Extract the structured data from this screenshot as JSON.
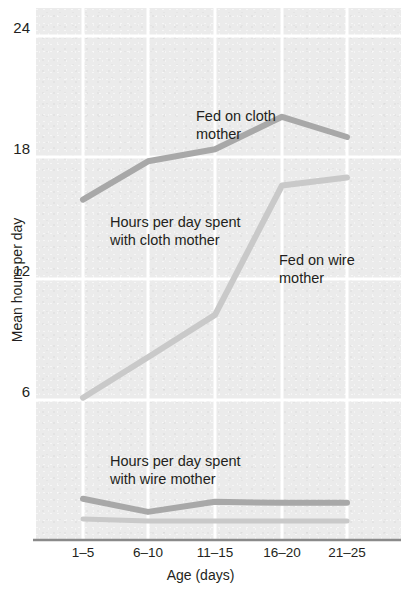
{
  "chart_data": {
    "type": "line",
    "title": "",
    "xlabel": "Age (days)",
    "ylabel": "Mean hours per day",
    "categories": [
      "1–5",
      "6–10",
      "11–15",
      "16–20",
      "21–25"
    ],
    "ylim": [
      0,
      25
    ],
    "yticks": [
      6,
      12,
      18,
      24
    ],
    "ytick_labels": [
      "6",
      "12",
      "18",
      "24"
    ],
    "grid": true,
    "legend": "annotations-inline",
    "series": [
      {
        "name": "Hours per day spent with cloth mother",
        "color": "#a8a8a8",
        "values": [
          15.9,
          17.8,
          18.4,
          20.0,
          19.0
        ]
      },
      {
        "name": "Hours per day spent with wire mother",
        "color": "#a8a8a8",
        "values": [
          1.1,
          0.45,
          0.95,
          0.9,
          0.9
        ]
      },
      {
        "name": "Fed on cloth mother",
        "color": "#c9c9c9",
        "values": [
          6.1,
          8.1,
          10.2,
          16.6,
          17.0
        ]
      },
      {
        "name": "Fed on wire mother",
        "color": "#c9c9c9",
        "values": [
          0.1,
          0.0,
          0.0,
          0.0,
          0.0
        ]
      }
    ],
    "annotations": [
      {
        "id": "fed-on-cloth",
        "text": "Fed on cloth\nmother"
      },
      {
        "id": "cloth-mother-contact",
        "text": "Hours per day spent\nwith cloth mother"
      },
      {
        "id": "fed-on-wire",
        "text": "Fed on wire\nmother"
      },
      {
        "id": "wire-mother-contact",
        "text": "Hours per day spent\nwith wire mother"
      }
    ],
    "colors": {
      "plot_background": "#ebebeb",
      "gridline": "#ffffff",
      "axis": "#8a8a8a",
      "dark_series": "#a8a8a8",
      "light_series": "#c9c9c9",
      "text": "#231f20"
    }
  }
}
